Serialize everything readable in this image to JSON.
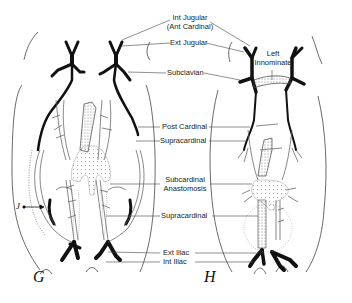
{
  "labels": {
    "int_jugular": "Int Jugular",
    "ant_cardinal": "(Ant Cardinal)",
    "ext_jugular": "Ext Jugular",
    "subclavian": "Subclavian",
    "left_innominate_1": "Left",
    "left_innominate_2": "Innominate",
    "post_cardinal": "Post Cardinal",
    "supracardinal_upper": "Supracardinal",
    "subcardinal_1": "Subcardinal",
    "subcardinal_2": "Anastomosis",
    "supracardinal_lower": "Supracardinal",
    "ext_iliac": "Ext Iliac",
    "int_iliac": "Int Iliac"
  },
  "figures": {
    "left": "G",
    "right": "H",
    "marker": "J"
  },
  "colors": {
    "vein": "#111111",
    "outline": "#444444",
    "stipple": "#888888"
  }
}
